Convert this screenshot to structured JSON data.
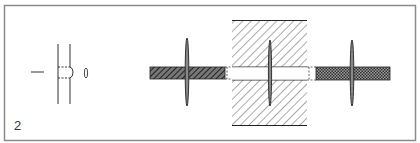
{
  "figure": {
    "number_label": "2",
    "colors": {
      "frame": "#8a8a8a",
      "line": "#222222",
      "hatch": "#333333",
      "background": "#ffffff"
    },
    "panels": [
      {
        "name": "schematic-symbol",
        "description": "Line symbol with through-bore and pin glyph"
      },
      {
        "name": "left-bar-with-pin",
        "description": "Diagonally hatched bar pierced by vertical pin"
      },
      {
        "name": "center-block-with-pin",
        "description": "Hatched block with open channel and vertical pin"
      },
      {
        "name": "right-bar-with-pin",
        "description": "Cross-hatched bar pierced by vertical pin"
      }
    ]
  }
}
